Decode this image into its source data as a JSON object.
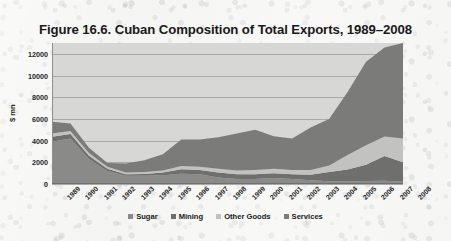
{
  "figure": {
    "title": "Figure 16.6. Cuban Composition of Total Exports, 1989–2008",
    "background_color": "#f4f4f2",
    "plot_background_color": "#d7d7d5"
  },
  "axes": {
    "y_title": "$ mn",
    "y_ticks": [
      "0",
      "2000",
      "4000",
      "6000",
      "8000",
      "10000",
      "12000"
    ],
    "x_ticks": [
      "1989",
      "1990",
      "1991",
      "1992",
      "1993",
      "1994",
      "1995",
      "1996",
      "1997",
      "1998",
      "1999",
      "2000",
      "2001",
      "2002",
      "2003",
      "2004",
      "2005",
      "2006",
      "2007",
      "2008"
    ]
  },
  "legend": {
    "items": [
      {
        "label": "Sugar",
        "color": "#8a8a88"
      },
      {
        "label": "Mining",
        "color": "#6f6f6d"
      },
      {
        "label": "Other Goods",
        "color": "#c2c2c0"
      },
      {
        "label": "Services",
        "color": "#7b7b79"
      }
    ]
  },
  "chart_data": {
    "type": "area",
    "stacked": true,
    "title": "Figure 16.6. Cuban Composition of Total Exports, 1989–2008",
    "xlabel": "",
    "ylabel": "$ mn",
    "ylim": [
      0,
      13000
    ],
    "ytick_step": 2000,
    "grid": true,
    "legend_position": "bottom",
    "x": [
      1989,
      1990,
      1991,
      1992,
      1993,
      1994,
      1995,
      1996,
      1997,
      1998,
      1999,
      2000,
      2001,
      2002,
      2003,
      2004,
      2005,
      2006,
      2007,
      2008
    ],
    "categories": [
      "1989",
      "1990",
      "1991",
      "1992",
      "1993",
      "1994",
      "1995",
      "1996",
      "1997",
      "1998",
      "1999",
      "2000",
      "2001",
      "2002",
      "2003",
      "2004",
      "2005",
      "2006",
      "2007",
      "2008"
    ],
    "series": [
      {
        "name": "Sugar",
        "color": "#8a8a88",
        "values": [
          3900,
          4200,
          2300,
          1200,
          750,
          760,
          800,
          950,
          900,
          600,
          450,
          450,
          550,
          450,
          350,
          250,
          230,
          280,
          290,
          200
        ]
      },
      {
        "name": "Mining",
        "color": "#6f6f6d",
        "values": [
          450,
          400,
          300,
          200,
          150,
          160,
          250,
          400,
          400,
          450,
          450,
          450,
          450,
          450,
          500,
          850,
          1100,
          1500,
          2300,
          1800
        ]
      },
      {
        "name": "Other Goods",
        "color": "#c2c2c0",
        "values": [
          300,
          280,
          250,
          180,
          150,
          180,
          200,
          300,
          300,
          350,
          350,
          400,
          400,
          400,
          450,
          600,
          1350,
          1800,
          1800,
          2200
        ]
      },
      {
        "name": "Services",
        "color": "#7b7b79",
        "values": [
          1100,
          700,
          500,
          350,
          850,
          1100,
          1500,
          2450,
          2500,
          2900,
          3400,
          3700,
          3000,
          2900,
          3900,
          4300,
          5800,
          7700,
          8200,
          8800
        ]
      }
    ],
    "totals": [
      5750,
      5580,
      3350,
      1930,
      1900,
      2200,
      2750,
      4100,
      4100,
      4300,
      4650,
      5000,
      4400,
      4200,
      5200,
      6000,
      8480,
      11280,
      12590,
      13000
    ]
  }
}
